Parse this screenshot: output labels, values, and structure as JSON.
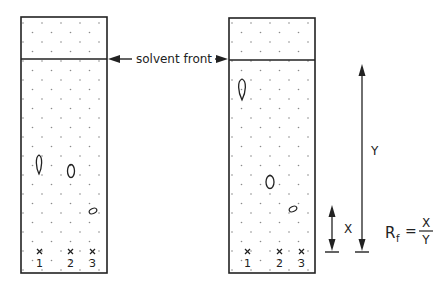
{
  "diagram": {
    "solvent_front_label": "solvent front",
    "lanes": [
      "1",
      "2",
      "3"
    ],
    "distance_labels": {
      "spot_distance": "X",
      "solvent_distance": "Y"
    },
    "formula": {
      "lhs_main": "R",
      "lhs_sub": "f",
      "equals": "=",
      "numerator": "X",
      "denominator": "Y"
    },
    "plates": [
      {
        "name": "left-plate",
        "spots": [
          "teardrop spot lane 1",
          "oval spot lane 2",
          "small oval spot lane 3"
        ]
      },
      {
        "name": "right-plate",
        "spots": [
          "teardrop spot lane 1",
          "oval spot lane 2",
          "small oval spot lane 3"
        ]
      }
    ],
    "colors": {
      "line": "#222222",
      "dot": "#8a8a8a",
      "background": "#ffffff"
    }
  }
}
